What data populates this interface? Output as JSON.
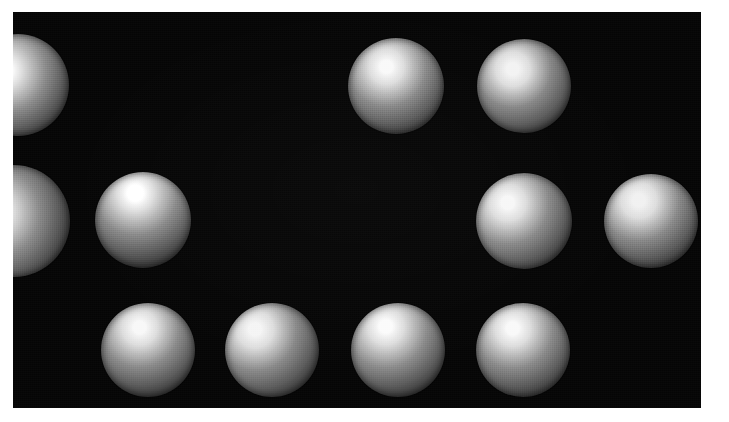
{
  "figure": {
    "kind": "shape-from-shading-stimulus",
    "background_color": "#ffffff",
    "panel_color": "#050505",
    "panel": {
      "x": 13,
      "y": 12,
      "width": 688,
      "height": 396
    },
    "canvas": {
      "width": 729,
      "height": 422
    }
  },
  "spheres": [
    {
      "id": "sphere-r1c1",
      "row": 1,
      "column": 1,
      "cx": 18,
      "cy": 85,
      "r": 51,
      "clipped": "left",
      "highlight_x_pct": 36,
      "highlight_y_pct": 36,
      "highlight_color": "#ffffff",
      "midtone_color": "#8e8e8e",
      "shadow_color": "#141414",
      "lighting_direction": "upper-left"
    },
    {
      "id": "sphere-r1c2",
      "row": 1,
      "column": 2,
      "cx": 396,
      "cy": 86,
      "r": 48,
      "clipped": "none",
      "highlight_x_pct": 40,
      "highlight_y_pct": 30,
      "highlight_color": "#f4f4f4",
      "midtone_color": "#8a8a8a",
      "shadow_color": "#121212",
      "lighting_direction": "upper-left"
    },
    {
      "id": "sphere-r1c3",
      "row": 1,
      "column": 3,
      "cx": 524,
      "cy": 86,
      "r": 47,
      "clipped": "none",
      "highlight_x_pct": 38,
      "highlight_y_pct": 32,
      "highlight_color": "#efefef",
      "midtone_color": "#878787",
      "shadow_color": "#111111",
      "lighting_direction": "upper-left"
    },
    {
      "id": "sphere-r2c1",
      "row": 2,
      "column": 1,
      "cx": 14,
      "cy": 221,
      "r": 56,
      "clipped": "left",
      "highlight_x_pct": 32,
      "highlight_y_pct": 42,
      "highlight_color": "#fbfbfb",
      "midtone_color": "#8d8d8d",
      "shadow_color": "#131313",
      "lighting_direction": "left"
    },
    {
      "id": "sphere-r2c2",
      "row": 2,
      "column": 2,
      "cx": 143,
      "cy": 220,
      "r": 48,
      "clipped": "none",
      "highlight_x_pct": 42,
      "highlight_y_pct": 22,
      "highlight_color": "#ffffff",
      "midtone_color": "#8b8b8b",
      "shadow_color": "#121212",
      "lighting_direction": "top"
    },
    {
      "id": "sphere-r2c3",
      "row": 2,
      "column": 3,
      "cx": 524,
      "cy": 221,
      "r": 48,
      "clipped": "none",
      "highlight_x_pct": 33,
      "highlight_y_pct": 31,
      "highlight_color": "#f2f2f2",
      "midtone_color": "#8a8a8a",
      "shadow_color": "#101010",
      "lighting_direction": "upper-left"
    },
    {
      "id": "sphere-r2c4",
      "row": 2,
      "column": 4,
      "cx": 651,
      "cy": 221,
      "r": 47,
      "clipped": "right",
      "highlight_x_pct": 37,
      "highlight_y_pct": 28,
      "highlight_color": "#ededed",
      "midtone_color": "#8a8a8a",
      "shadow_color": "#121212",
      "lighting_direction": "upper-left"
    },
    {
      "id": "sphere-r3c1",
      "row": 3,
      "column": 1,
      "cx": 148,
      "cy": 350,
      "r": 47,
      "clipped": "none",
      "highlight_x_pct": 41,
      "highlight_y_pct": 26,
      "highlight_color": "#f3f3f3",
      "midtone_color": "#8b8b8b",
      "shadow_color": "#141414",
      "lighting_direction": "upper-left"
    },
    {
      "id": "sphere-r3c2",
      "row": 3,
      "column": 2,
      "cx": 272,
      "cy": 350,
      "r": 47,
      "clipped": "none",
      "highlight_x_pct": 32,
      "highlight_y_pct": 28,
      "highlight_color": "#f0f0f0",
      "midtone_color": "#898989",
      "shadow_color": "#101010",
      "lighting_direction": "upper-left"
    },
    {
      "id": "sphere-r3c3",
      "row": 3,
      "column": 3,
      "cx": 398,
      "cy": 350,
      "r": 47,
      "clipped": "none",
      "highlight_x_pct": 37,
      "highlight_y_pct": 25,
      "highlight_color": "#f6f6f6",
      "midtone_color": "#8c8c8c",
      "shadow_color": "#101010",
      "lighting_direction": "upper-left"
    },
    {
      "id": "sphere-r3c4",
      "row": 3,
      "column": 4,
      "cx": 523,
      "cy": 350,
      "r": 47,
      "clipped": "none",
      "highlight_x_pct": 39,
      "highlight_y_pct": 27,
      "highlight_color": "#f4f4f4",
      "midtone_color": "#8b8b8b",
      "shadow_color": "#111111",
      "lighting_direction": "upper-left"
    }
  ]
}
